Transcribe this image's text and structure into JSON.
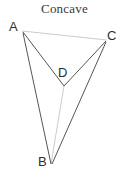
{
  "figure": {
    "title": "Concave",
    "canvas": {
      "width": 129,
      "height": 177,
      "background": "#ffffff"
    },
    "colors": {
      "solid_edge": "#555555",
      "faint_edge": "#cccccc",
      "label_text": "#2e2e2e",
      "title_text": "#3a3a3a"
    },
    "vertices": [
      {
        "id": "A",
        "label": "A",
        "x": 22,
        "y": 31,
        "label_x": 9,
        "label_y": 20
      },
      {
        "id": "C",
        "label": "C",
        "x": 107,
        "y": 40,
        "label_x": 107,
        "label_y": 29
      },
      {
        "id": "D",
        "label": "D",
        "x": 64,
        "y": 86,
        "label_x": 58,
        "label_y": 66
      },
      {
        "id": "B",
        "label": "B",
        "x": 51,
        "y": 164,
        "label_x": 38,
        "label_y": 155
      }
    ],
    "edges": [
      {
        "id": "AC",
        "from": "A",
        "to": "C",
        "style": "faint",
        "x1": 22,
        "y1": 31,
        "x2": 107,
        "y2": 40
      },
      {
        "id": "AD",
        "from": "A",
        "to": "D",
        "style": "solid",
        "x1": 23,
        "y1": 32,
        "x2": 64,
        "y2": 86
      },
      {
        "id": "CD",
        "from": "C",
        "to": "D",
        "style": "solid",
        "x1": 106,
        "y1": 41,
        "x2": 64,
        "y2": 86
      },
      {
        "id": "AB",
        "from": "A",
        "to": "B",
        "style": "solid",
        "x1": 23,
        "y1": 33,
        "x2": 51,
        "y2": 164
      },
      {
        "id": "CB",
        "from": "C",
        "to": "B",
        "style": "solid",
        "x1": 106,
        "y1": 42,
        "x2": 52,
        "y2": 164
      },
      {
        "id": "DB",
        "from": "D",
        "to": "B",
        "style": "faint",
        "x1": 64,
        "y1": 86,
        "x2": 51,
        "y2": 164
      }
    ]
  }
}
